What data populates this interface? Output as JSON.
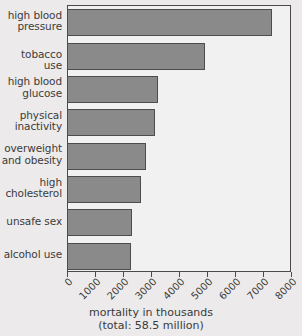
{
  "chart_data": {
    "type": "bar",
    "orientation": "horizontal",
    "title": "",
    "xlabel": "mortality in thousands",
    "xlabel_sub": "(total: 58.5 million)",
    "ylabel": "",
    "categories": [
      "high blood pressure",
      "tobacco use",
      "high blood glucose",
      "physical inactivity",
      "overweight and obesity",
      "high cholesterol",
      "unsafe sex",
      "alcohol use"
    ],
    "category_lines": [
      [
        "high blood",
        "pressure"
      ],
      [
        "tobacco use"
      ],
      [
        "high blood",
        "glucose"
      ],
      [
        "physical",
        "inactivity"
      ],
      [
        "overweight",
        "and obesity"
      ],
      [
        "high",
        "cholesterol"
      ],
      [
        "unsafe sex"
      ],
      [
        "alcohol use"
      ]
    ],
    "values": [
      7300,
      4900,
      3200,
      3100,
      2800,
      2600,
      2300,
      2250
    ],
    "xlim": [
      0,
      8000
    ],
    "xticks": [
      0,
      1000,
      2000,
      3000,
      4000,
      5000,
      6000,
      7000,
      8000
    ],
    "xticklabels": [
      "0",
      "1000",
      "2000",
      "3000",
      "4000",
      "5000",
      "6000",
      "7000",
      "8000"
    ],
    "grid": false,
    "legend": null,
    "bar_color": "#8a8a8a",
    "bar_edge_color": "#4d4d4d",
    "plot_background": "#f2f1f1",
    "figure_background": "#eceaea",
    "axis_color": "#4a4a4a",
    "text_color": "#3a3a3a"
  }
}
